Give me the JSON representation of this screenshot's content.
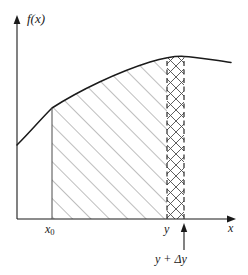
{
  "figure": {
    "axes": {
      "y_axis_label": "f(x)",
      "x_axis_label": "x",
      "x_axis_label_name": "x-axis-label",
      "y_axis_label_name": "y-axis-label"
    },
    "tick_labels": {
      "x0_base": "x",
      "x0_subscript": "0",
      "y": "y",
      "y_plus_delta_y": "y + Δy"
    },
    "colors": {
      "background": "#ffffff",
      "axis": "#1a1a1a",
      "curve": "#1a1a1a",
      "hatch": "#7a7a7a",
      "crosshatch": "#555555",
      "dashed": "#333333",
      "text": "#1a1a1a"
    },
    "geometry": {
      "y_axis_x": 17,
      "x_axis_y": 219,
      "x0_x": 52,
      "y_x": 167,
      "y_plus_dy_x": 184,
      "curve_left_x": 17,
      "curve_left_y": 145,
      "curve_peak_x": 184,
      "curve_peak_y": 57,
      "curve_right_x": 231,
      "curve_right_y": 62,
      "hatch_spacing": 13,
      "crosshatch_spacing": 11
    },
    "regions": {
      "diagonal_hatched_region": "area-under-curve-x0-to-y",
      "cross_hatched_region": "area-increment-delta-y"
    },
    "annotations": {
      "delta_arrow": "arrow-pointing-to-y-plus-delta-y"
    }
  }
}
